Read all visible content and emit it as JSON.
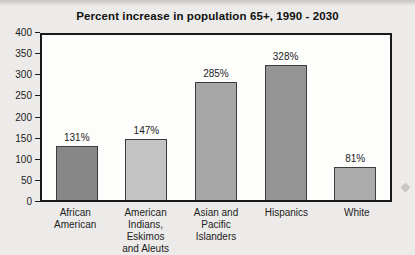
{
  "figure": {
    "background_color": "#ecebe9",
    "plot_background_color": "#fdfdfc",
    "plot_border_color": "#1a1a1a",
    "text_color": "#1c1c1c"
  },
  "chart_data": {
    "type": "bar",
    "title": "Percent increase in population 65+, 1990 - 2030",
    "xlabel": "",
    "ylabel": "",
    "categories": [
      "African\nAmerican",
      "American Indians,\nEskimos\nand Aleuts",
      "Asian and\nPacific Islanders",
      "Hispanics",
      "White"
    ],
    "values": [
      131,
      147,
      285,
      328,
      81
    ],
    "value_labels": [
      "131%",
      "147%",
      "285%",
      "328%",
      "81%"
    ],
    "bar_colors": [
      "#878787",
      "#c4c4c4",
      "#a6a6a6",
      "#959595",
      "#acacac"
    ],
    "bar_border_color": "#3d3d3d",
    "ylim": [
      0,
      400
    ],
    "yticks": [
      0,
      50,
      100,
      150,
      200,
      250,
      300,
      350,
      400
    ],
    "grid": false,
    "legend": null
  }
}
